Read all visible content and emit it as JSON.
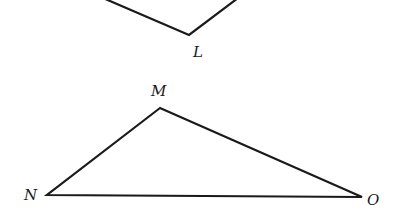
{
  "figure": {
    "top_shape": {
      "vertex_label": "L",
      "points": [
        [
          103,
          0
        ],
        [
          189,
          35
        ],
        [
          238,
          0
        ]
      ],
      "label_pos": [
        193,
        57
      ]
    },
    "triangle": {
      "vertices": [
        {
          "name": "M",
          "x": 160,
          "y": 108,
          "label_x": 151,
          "label_y": 96
        },
        {
          "name": "N",
          "x": 47,
          "y": 195,
          "label_x": 24,
          "label_y": 200
        },
        {
          "name": "O",
          "x": 362,
          "y": 197,
          "label_x": 367,
          "label_y": 205
        }
      ]
    },
    "stroke_color": "#1a1a1a",
    "background": "#ffffff"
  }
}
